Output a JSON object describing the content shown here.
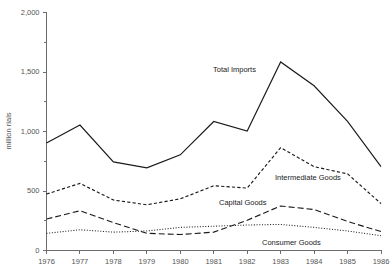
{
  "chart_data": {
    "type": "line",
    "title": "",
    "xlabel": "",
    "ylabel": "million rials",
    "ylim": [
      0,
      2000
    ],
    "yticks": [
      0,
      500,
      1000,
      1500,
      2000
    ],
    "ytick_labels": [
      "0",
      "500",
      "1,000",
      "1,500",
      "2,000"
    ],
    "grid": false,
    "legend_position": "inline-annotations",
    "categories": [
      1976,
      1977,
      1978,
      1979,
      1980,
      1981,
      1982,
      1983,
      1984,
      1985,
      1986
    ],
    "xtick_labels": [
      "1976",
      "1977",
      "1978",
      "1979",
      "1980",
      "1981",
      "1982",
      "1983",
      "1984",
      "1985",
      "1986"
    ],
    "series": [
      {
        "name": "Total Imports",
        "style": "solid",
        "label": "Total Imports",
        "values": [
          900,
          1050,
          740,
          690,
          800,
          1080,
          1000,
          1580,
          1380,
          1080,
          700
        ]
      },
      {
        "name": "Intermediate Goods",
        "style": "dashed-short",
        "label": "Intermediate Goods",
        "values": [
          470,
          560,
          420,
          380,
          430,
          540,
          520,
          860,
          700,
          640,
          390
        ]
      },
      {
        "name": "Capital Goods",
        "style": "dashed-long",
        "label": "Capital Goods",
        "values": [
          260,
          330,
          230,
          140,
          130,
          150,
          250,
          370,
          340,
          240,
          155
        ]
      },
      {
        "name": "Consumer Goods",
        "style": "dotted",
        "label": "Consumer Goods",
        "values": [
          140,
          170,
          150,
          160,
          190,
          200,
          210,
          215,
          190,
          160,
          120
        ]
      }
    ]
  },
  "axis": {
    "y_title": "million rials"
  }
}
